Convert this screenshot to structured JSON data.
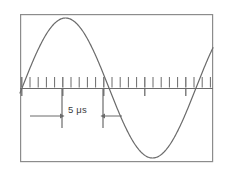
{
  "figure": {
    "kind": "oscilloscope-waveform-display",
    "frame": {
      "x": 20,
      "y": 14,
      "width": 193,
      "height": 148,
      "stroke_color": "#8c8c8c",
      "stroke_width": 1.2,
      "fill_color": "#ffffff"
    },
    "baseline": {
      "y": 88,
      "x_start": 20,
      "x_end": 213,
      "stroke_color": "#6b6b6b",
      "stroke_width": 1
    }
  },
  "annotation": {
    "measurement_label": "5 μs",
    "label_text_color": "#3c3c3c",
    "left_arrow_icon": "arrow-right-icon",
    "right_arrow_icon": "arrow-left-icon",
    "marker_left_x": 62,
    "marker_right_x": 103,
    "marker_top_y": 88,
    "marker_bottom_y": 128,
    "arrow_y": 116,
    "left_arrow_from_x": 30,
    "left_arrow_to_x": 60,
    "right_arrow_from_x": 122,
    "right_arrow_to_x": 105,
    "stroke_color": "#6b6b6b"
  },
  "ticks": {
    "minor_spacing_px": 8.2,
    "minor_height_px": 11,
    "major_height_px": 8,
    "major_every": 5,
    "first_x": 21.8,
    "count": 24,
    "stroke_color": "#6b6b6b",
    "minor_width": 1,
    "major_width": 1.3
  },
  "chart_data": {
    "type": "line",
    "title": "",
    "subtitle": "",
    "xlabel": "",
    "ylabel": "",
    "legend": [],
    "grid": false,
    "axis_ranges": {
      "x": [
        20,
        213
      ],
      "y": [
        14,
        162
      ]
    },
    "waveform": {
      "shape": "sine",
      "amplitude_px": 70,
      "baseline_y": 88,
      "period_px": 174,
      "phase_x_zero_rising": 22,
      "peak": {
        "x": 75,
        "y": 18
      },
      "descending_zero_crossing": {
        "x": 103,
        "y": 88
      },
      "trough": {
        "x": 160,
        "y": 152
      },
      "second_rising_zero_crossing": {
        "x": 196,
        "y": 88
      },
      "stroke_color": "#6b6b6b",
      "stroke_width": 1.2
    },
    "time_scale": {
      "measured_interval_label": "5 μs",
      "measured_interval_value": 5,
      "measured_interval_unit": "μs",
      "minor_ticks_per_measured_interval": 5,
      "minor_tick_value": 1,
      "period_in_us": 21.2
    },
    "series": [
      {
        "name": "signal",
        "x": [
          20,
          26,
          33,
          40,
          47,
          53,
          60,
          66,
          71,
          75,
          80,
          85,
          90,
          96,
          103,
          110,
          117,
          124,
          131,
          138,
          145,
          152,
          160,
          168,
          175,
          182,
          189,
          196,
          203,
          209,
          213
        ],
        "y": [
          94,
          79,
          62,
          47,
          34,
          26,
          21,
          18,
          17,
          18,
          21,
          26,
          34,
          46,
          61,
          78,
          97,
          114,
          129,
          141,
          148,
          152,
          153,
          150,
          143,
          132,
          117,
          99,
          79,
          62,
          54
        ]
      }
    ]
  }
}
